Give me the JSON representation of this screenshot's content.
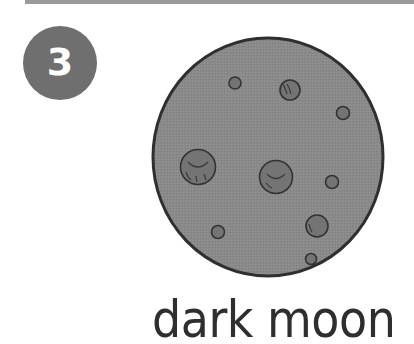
{
  "step": {
    "number": "3",
    "badge_color": "#6f6f6f"
  },
  "illustration": {
    "subject": "moon-icon",
    "fill_color": "#8a8a8a",
    "crater_color": "#747474",
    "outline_color": "#2f2f2f"
  },
  "caption": {
    "text": "dark moon"
  }
}
